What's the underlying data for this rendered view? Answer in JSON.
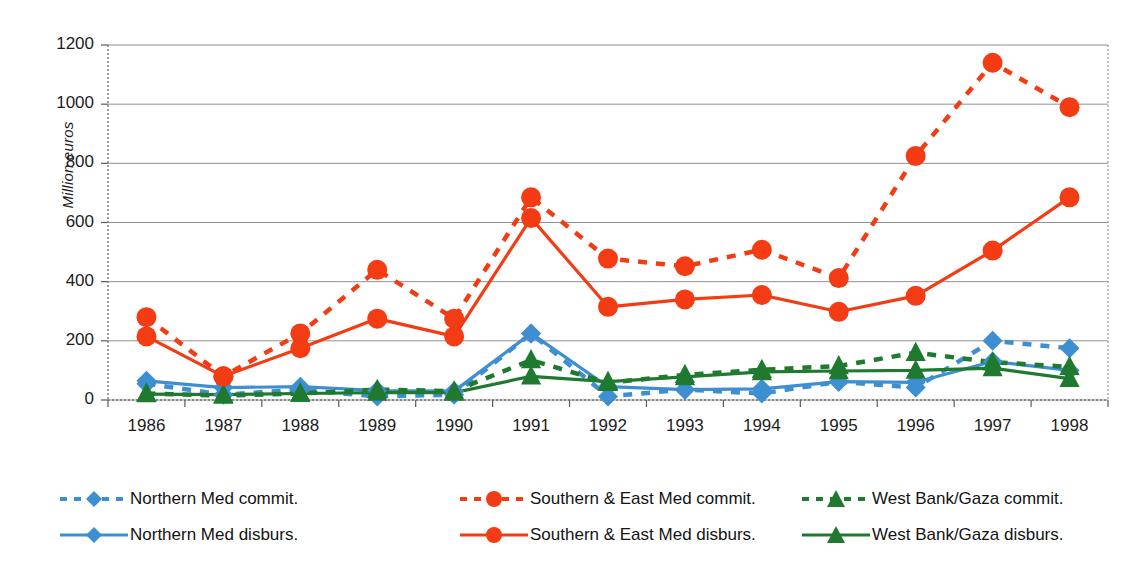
{
  "chart_data": {
    "type": "line",
    "title": "",
    "xlabel": "",
    "ylabel": "Million euros",
    "ylim": [
      0,
      1200
    ],
    "ytick_step": 200,
    "yticks": [
      "0",
      "200",
      "400",
      "600",
      "800",
      "1000",
      "1200"
    ],
    "grid": "horizontal",
    "legend_position": "bottom",
    "categories": [
      "1986",
      "1987",
      "1988",
      "1989",
      "1990",
      "1991",
      "1992",
      "1993",
      "1994",
      "1995",
      "1996",
      "1997",
      "1998"
    ],
    "series": [
      {
        "name": "Northern Med commit.",
        "key": "northern-med-commit",
        "color": "#3D8FD1",
        "style": "dashed",
        "marker": "diamond",
        "values": [
          55,
          18,
          35,
          12,
          18,
          225,
          12,
          35,
          22,
          62,
          42,
          200,
          175
        ]
      },
      {
        "name": "Northern Med disburs.",
        "key": "northern-med-disburs",
        "color": "#3D8FD1",
        "style": "solid",
        "marker": "diamond",
        "values": [
          65,
          42,
          45,
          32,
          30,
          225,
          45,
          35,
          38,
          62,
          60,
          130,
          100
        ]
      },
      {
        "name": "Southern & East Med commit.",
        "key": "southern-east-med-commit",
        "color": "#F33C14",
        "style": "dashed",
        "marker": "circle",
        "values": [
          280,
          80,
          225,
          440,
          275,
          685,
          478,
          452,
          508,
          412,
          825,
          1140,
          990
        ]
      },
      {
        "name": "Southern & East Med disburs.",
        "key": "southern-east-med-disburs",
        "color": "#F33C14",
        "style": "solid",
        "marker": "circle",
        "values": [
          215,
          80,
          175,
          275,
          215,
          615,
          315,
          340,
          355,
          298,
          352,
          505,
          685
        ]
      },
      {
        "name": "West Bank/Gaza commit.",
        "key": "west-bank-gaza-commit",
        "color": "#1F7A30",
        "style": "dashed",
        "marker": "triangle",
        "values": [
          22,
          15,
          22,
          35,
          30,
          135,
          58,
          85,
          102,
          115,
          160,
          128,
          112
        ]
      },
      {
        "name": "West Bank/Gaza disburs.",
        "key": "west-bank-gaza-disburs",
        "color": "#1F7A30",
        "style": "solid",
        "marker": "triangle",
        "values": [
          20,
          18,
          22,
          25,
          25,
          80,
          62,
          78,
          95,
          98,
          100,
          108,
          72
        ]
      }
    ]
  },
  "axis": {
    "y_title": "Million euros"
  },
  "legend": {
    "entries": [
      {
        "label": "Northern Med commit.",
        "series_key": "northern-med-commit"
      },
      {
        "label": "Southern & East Med commit.",
        "series_key": "southern-east-med-commit"
      },
      {
        "label": "West Bank/Gaza commit.",
        "series_key": "west-bank-gaza-commit"
      },
      {
        "label": "Northern Med disburs.",
        "series_key": "northern-med-disburs"
      },
      {
        "label": "Southern & East Med disburs.",
        "series_key": "southern-east-med-disburs"
      },
      {
        "label": "West Bank/Gaza disburs.",
        "series_key": "west-bank-gaza-disburs"
      }
    ]
  },
  "colors": {
    "northern_med": "#3D8FD1",
    "southern_east_med": "#F33C14",
    "west_bank_gaza": "#1F7A30",
    "gridline": "#8a8a8a",
    "axis": "#6e6e6e"
  }
}
